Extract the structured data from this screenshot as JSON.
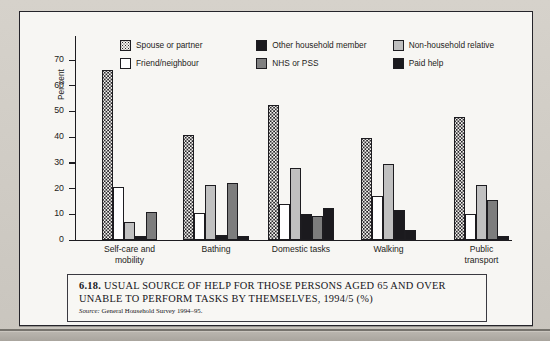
{
  "figure": {
    "y_axis_title": "Per cent",
    "caption_number": "6.18.",
    "caption_text": "USUAL SOURCE OF HELP FOR THOSE PERSONS AGED 65 AND OVER UNABLE TO PERFORM TASKS BY THEMSELVES, 1994/5 (%)",
    "source_prefix": "Source:",
    "source_text": "General Household Survey 1994–95."
  },
  "chart_data": {
    "type": "bar",
    "title": "Usual source of help for those persons aged 65 and over unable to perform tasks by themselves, 1994/5 (%)",
    "xlabel": "",
    "ylabel": "Per cent",
    "ylim": [
      0,
      72
    ],
    "yticks": [
      0,
      10,
      20,
      30,
      40,
      50,
      60,
      70
    ],
    "ytick_labels": [
      "0",
      "10",
      "20",
      "30",
      "40",
      "50",
      "60",
      "70"
    ],
    "grid": false,
    "legend_position": "top",
    "categories": [
      "Self-care and mobility",
      "Bathing",
      "Domestic tasks",
      "Walking",
      "Public transport"
    ],
    "category_lines": [
      [
        "Self-care and",
        "mobility"
      ],
      [
        "Bathing"
      ],
      [
        "Domestic tasks"
      ],
      [
        "Walking"
      ],
      [
        "Public",
        "transport"
      ]
    ],
    "series": [
      {
        "name": "Spouse or partner",
        "pattern": "dot",
        "color": "#f4f2ee",
        "values": [
          66,
          41,
          52.5,
          39.5,
          48
        ]
      },
      {
        "name": "Friend/neighbour",
        "pattern": "white",
        "color": "#ffffff",
        "values": [
          20.5,
          10.5,
          14,
          17,
          10
        ]
      },
      {
        "name": "Other household member",
        "pattern": "black",
        "color": "#1b1a1e",
        "values": [
          0,
          2,
          10,
          0,
          0
        ]
      },
      {
        "name": "NHS or PSS",
        "pattern": "dkgray",
        "color": "#7d7d7d",
        "values": [
          7,
          21.5,
          9.5,
          29.5,
          21.5
        ]
      },
      {
        "name": "Non-household relative",
        "pattern": "ltgray",
        "color": "#c0c0c0",
        "values": [
          1.5,
          22,
          12.5,
          11.5,
          15.5
        ]
      },
      {
        "name": "Paid help",
        "pattern": "black2",
        "color": "#1b1a1e",
        "values": [
          11,
          1.5,
          0,
          4,
          1.5
        ]
      }
    ],
    "legend_entries": [
      {
        "label": "Spouse or partner",
        "swatch": "dot"
      },
      {
        "label": "Other household member",
        "swatch": "black"
      },
      {
        "label": "Non-household relative",
        "swatch": "ltgray"
      },
      {
        "label": "Friend/neighbour",
        "swatch": "white"
      },
      {
        "label": "NHS or PSS",
        "swatch": "dkgray"
      },
      {
        "label": "Paid help",
        "swatch": "black"
      }
    ],
    "bar_groups": [
      {
        "category": "Self-care and mobility",
        "bars": [
          {
            "series": "Spouse or partner",
            "value": 66,
            "style": "dot"
          },
          {
            "series": "Friend/neighbour",
            "value": 20.5,
            "style": "white"
          },
          {
            "series": "Non-household relative",
            "value": 7,
            "style": "ltgray"
          },
          {
            "series": "Other household member",
            "value": 1.5,
            "style": "black"
          },
          {
            "series": "NHS or PSS",
            "value": 11,
            "style": "dkgray"
          }
        ]
      },
      {
        "category": "Bathing",
        "bars": [
          {
            "series": "Spouse or partner",
            "value": 41,
            "style": "dot"
          },
          {
            "series": "Friend/neighbour",
            "value": 10.5,
            "style": "white"
          },
          {
            "series": "Non-household relative",
            "value": 21.5,
            "style": "ltgray"
          },
          {
            "series": "Other household member",
            "value": 2,
            "style": "black"
          },
          {
            "series": "NHS or PSS",
            "value": 22,
            "style": "dkgray"
          },
          {
            "series": "Paid help",
            "value": 1.5,
            "style": "black"
          }
        ]
      },
      {
        "category": "Domestic tasks",
        "bars": [
          {
            "series": "Spouse or partner",
            "value": 52.5,
            "style": "dot"
          },
          {
            "series": "Friend/neighbour",
            "value": 14,
            "style": "white"
          },
          {
            "series": "Non-household relative",
            "value": 28,
            "style": "ltgray"
          },
          {
            "series": "Other household member",
            "value": 10,
            "style": "black"
          },
          {
            "series": "NHS or PSS",
            "value": 9.5,
            "style": "dkgray"
          },
          {
            "series": "Paid help",
            "value": 12.5,
            "style": "black"
          }
        ]
      },
      {
        "category": "Walking",
        "bars": [
          {
            "series": "Spouse or partner",
            "value": 39.5,
            "style": "dot"
          },
          {
            "series": "Friend/neighbour",
            "value": 17,
            "style": "white"
          },
          {
            "series": "Non-household relative",
            "value": 29.5,
            "style": "ltgray"
          },
          {
            "series": "Other household member",
            "value": 11.5,
            "style": "black"
          },
          {
            "series": "Paid help",
            "value": 4,
            "style": "black"
          }
        ]
      },
      {
        "category": "Public transport",
        "bars": [
          {
            "series": "Spouse or partner",
            "value": 48,
            "style": "dot"
          },
          {
            "series": "Friend/neighbour",
            "value": 10,
            "style": "white"
          },
          {
            "series": "Non-household relative",
            "value": 21.5,
            "style": "ltgray"
          },
          {
            "series": "NHS or PSS",
            "value": 15.5,
            "style": "dkgray"
          },
          {
            "series": "Paid help",
            "value": 1.5,
            "style": "black"
          }
        ]
      }
    ]
  }
}
